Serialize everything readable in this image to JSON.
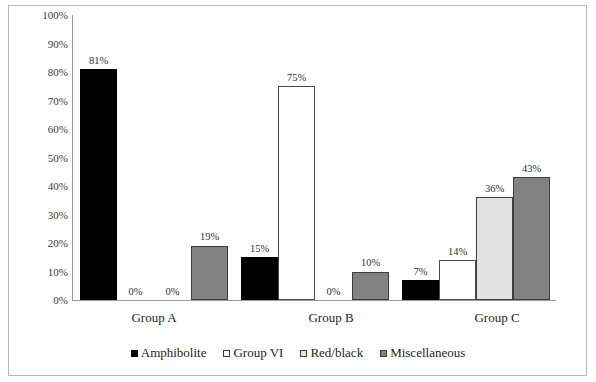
{
  "chart_data": {
    "type": "bar",
    "title": "",
    "subtitle": "",
    "xlabel": "",
    "ylabel": "",
    "categories": [
      "Group A",
      "Group B",
      "Group C"
    ],
    "series": [
      {
        "name": "Amphibolite",
        "color": "#000000",
        "values": [
          81,
          0,
          7
        ]
      },
      {
        "name": "Group VI",
        "color": "#ffffff",
        "values": [
          0,
          75,
          14
        ]
      },
      {
        "name": "Red/black",
        "color": "#e2e2e2",
        "values": [
          0,
          0,
          36
        ]
      },
      {
        "name": "Miscellaneous",
        "color": "#828282",
        "values": [
          19,
          10,
          43
        ]
      }
    ],
    "value_labels": [
      [
        "81%",
        "0%",
        "0%",
        "19%"
      ],
      [
        "15%",
        "75%",
        "0%",
        "10%"
      ],
      [
        "7%",
        "14%",
        "36%",
        "43%"
      ]
    ],
    "amphibolite_group_b_value": 15,
    "ylim": [
      0,
      100
    ],
    "ytick_values": [
      0,
      10,
      20,
      30,
      40,
      50,
      60,
      70,
      80,
      90,
      100
    ],
    "ytick_labels": [
      "0%",
      "10%",
      "20%",
      "30%",
      "40%",
      "50%",
      "60%",
      "70%",
      "80%",
      "90%",
      "100%"
    ],
    "grid": false,
    "legend_position": "bottom",
    "legend_entries": [
      "Amphibolite",
      "Group VI",
      "Red/black",
      "Miscellaneous"
    ]
  },
  "figure": {
    "border_color": "#b8b8b8",
    "axis_color": "#9a9a9a",
    "background": "#ffffff"
  }
}
